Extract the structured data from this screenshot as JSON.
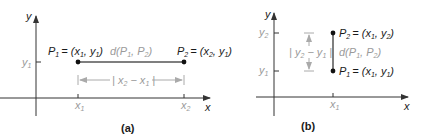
{
  "figure": {
    "panels": [
      {
        "id": "a",
        "caption": "(a)",
        "axes": {
          "x_label": "x",
          "y_label": "y"
        },
        "ticks": {
          "y": [
            "y1"
          ],
          "x": [
            "x1",
            "x2"
          ]
        },
        "tick_labels": {
          "y1": "y",
          "y1_sub": "1",
          "x1": "x",
          "x1_sub": "1",
          "x2": "x",
          "x2_sub": "2"
        },
        "points": [
          {
            "name": "P1",
            "label_main": "P",
            "label_sub": "1",
            "coords": "= (x",
            "coords_sub1": "1",
            "coords_mid": ", y",
            "coords_sub2": "1",
            "coords_end": ")"
          },
          {
            "name": "P2",
            "label_main": "P",
            "label_sub": "2",
            "coords": "= (x",
            "coords_sub1": "2",
            "coords_mid": ", y",
            "coords_sub2": "1",
            "coords_end": ")"
          }
        ],
        "distance_label": {
          "pre": "d(P",
          "sub1": "1",
          "mid": ", P",
          "sub2": "2",
          "end": ")"
        },
        "measure_label": {
          "pre": "| x",
          "sub1": "2",
          "mid": " − x",
          "sub2": "1",
          "end": " |"
        }
      },
      {
        "id": "b",
        "caption": "(b)",
        "axes": {
          "x_label": "x",
          "y_label": "y"
        },
        "tick_labels": {
          "y2": "y",
          "y2_sub": "2",
          "y1": "y",
          "y1_sub": "1",
          "x1": "x",
          "x1_sub": "1"
        },
        "points": [
          {
            "name": "P2",
            "label_main": "P",
            "label_sub": "2",
            "coords": "= (x",
            "coords_sub1": "1",
            "coords_mid": ", y",
            "coords_sub2": "2",
            "coords_end": ")"
          },
          {
            "name": "P1",
            "label_main": "P",
            "label_sub": "1",
            "coords": "= (x",
            "coords_sub1": "1",
            "coords_mid": ", y",
            "coords_sub2": "1",
            "coords_end": ")"
          }
        ],
        "distance_label": {
          "pre": "d(P",
          "sub1": "1",
          "mid": ", P",
          "sub2": "2",
          "end": ")"
        },
        "measure_label": {
          "pre": "| y",
          "sub1": "2",
          "mid": " − y",
          "sub2": "1",
          "end": " |"
        }
      }
    ],
    "colors": {
      "axis": "#333333",
      "segment": "#555555",
      "point": "#111111",
      "gray_text": "#9a9a9a",
      "text": "#1a1a1a"
    }
  }
}
